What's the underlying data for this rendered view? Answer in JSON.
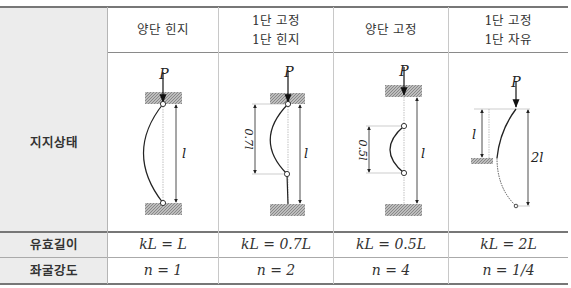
{
  "table": {
    "columns": [
      {
        "header_line1": "양단 힌지",
        "header_line2": "",
        "effective_length": "kL = L",
        "buckling_strength": "n = 1",
        "diagram": {
          "load": "P",
          "dims": [
            "l"
          ]
        }
      },
      {
        "header_line1": "1단 고정",
        "header_line2": "1단 힌지",
        "effective_length": "kL = 0.7L",
        "buckling_strength": "n = 2",
        "diagram": {
          "load": "P",
          "dims": [
            "0.7l",
            "l"
          ]
        }
      },
      {
        "header_line1": "양단 고정",
        "header_line2": "",
        "effective_length": "kL = 0.5L",
        "buckling_strength": "n = 4",
        "diagram": {
          "load": "P",
          "dims": [
            "0.5l",
            "l"
          ]
        }
      },
      {
        "header_line1": "1단 고정",
        "header_line2": "1단 자유",
        "effective_length": "kL = 2L",
        "buckling_strength": "n = 1/4",
        "diagram": {
          "load": "P",
          "dims": [
            "l",
            "2l"
          ]
        }
      }
    ],
    "row_labels": {
      "support_condition": "지지상태",
      "effective_length": "유효길이",
      "buckling_strength": "좌굴강도"
    }
  },
  "colors": {
    "label_column_bg": "#ececec",
    "rule": "#8a8a8a",
    "hatch": "#9a9a9a"
  }
}
